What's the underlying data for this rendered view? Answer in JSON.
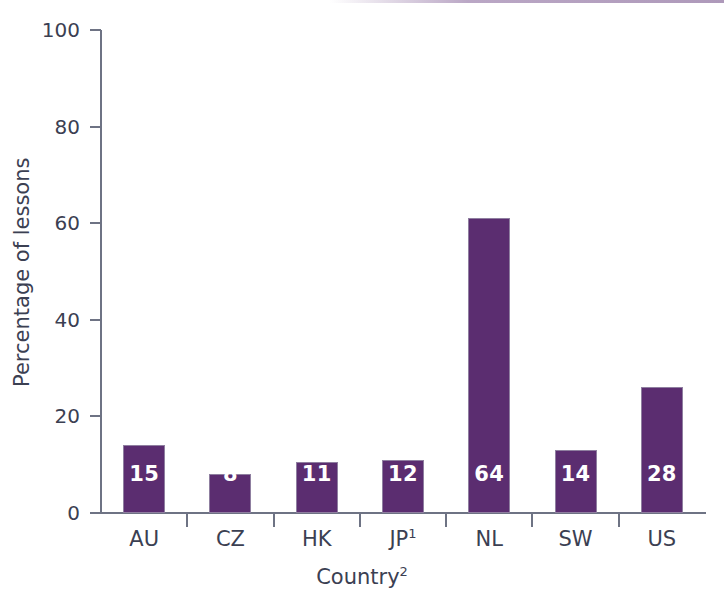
{
  "chart_data": {
    "type": "bar",
    "title": "",
    "subtitle": "",
    "xlabel": "Country",
    "xlabel_sup": "2",
    "ylabel": "Percentage of lessons",
    "ylim": [
      0,
      100
    ],
    "yticks": [
      0,
      20,
      40,
      60,
      80,
      100
    ],
    "grid": false,
    "legend": null,
    "categories": [
      "AU",
      "CZ",
      "HK",
      "JP",
      "NL",
      "SW",
      "US"
    ],
    "category_sup": [
      "",
      "",
      "",
      "1",
      "",
      "",
      ""
    ],
    "values": [
      15,
      8,
      11,
      12,
      64,
      14,
      28
    ],
    "bar_heights": [
      14,
      8,
      10.5,
      11,
      61,
      13,
      26
    ],
    "data_labels": [
      "15",
      "8",
      "11",
      "12",
      "64",
      "14",
      "28"
    ],
    "bar_color": "#5b2d70",
    "bar_edge_color": "#8f7fa0",
    "label_color": "#ffffff",
    "axis_color": "#6e7384",
    "text_color": "#3b4052",
    "background": "#ffffff"
  }
}
